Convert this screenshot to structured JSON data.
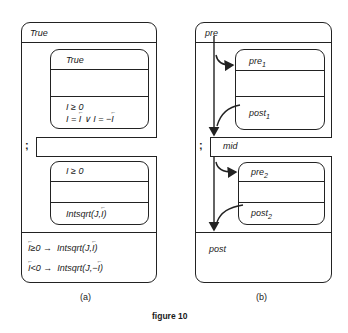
{
  "figure": {
    "caption": "figure 10",
    "panel_a": {
      "label": "(a)",
      "outer_pre": "True",
      "block1": {
        "pre": "True",
        "post_line1": "I ≥ 0",
        "post_line2_parts": [
          "I = ",
          "I",
          " ∨ I = −",
          "I"
        ]
      },
      "separator": ";",
      "block2": {
        "pre": "I ≥ 0",
        "post_parts": [
          "Intsqrt(J,",
          "I",
          ")"
        ]
      },
      "outer_post": [
        {
          "cond": "I",
          "cond_rest": "≥0 →",
          "result_prefix": "Intsqrt(J,",
          "result_var": "I",
          "result_suffix": ")"
        },
        {
          "cond": "I",
          "cond_rest": "<0 →",
          "result_prefix": "Intsqrt(J,−",
          "result_var": "I",
          "result_suffix": ")"
        }
      ]
    },
    "panel_b": {
      "label": "(b)",
      "outer_pre": "pre",
      "block1": {
        "pre": "pre",
        "pre_sub": "1",
        "post": "post",
        "post_sub": "1"
      },
      "separator": ";",
      "mid": "mid",
      "block2": {
        "pre": "pre",
        "pre_sub": "2",
        "post": "post",
        "post_sub": "2"
      },
      "outer_post": "post"
    }
  }
}
